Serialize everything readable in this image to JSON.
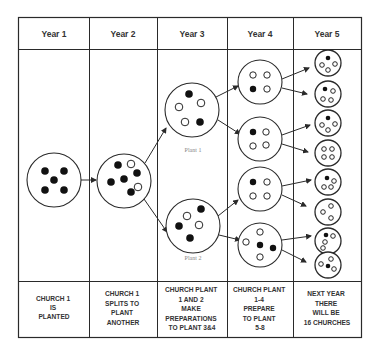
{
  "colors": {
    "line": "#2a2a2a",
    "text": "#333333",
    "label_grey": "#888888",
    "background": "#ffffff"
  },
  "columns": [
    {
      "header": "Year 1",
      "footer": [
        "CHURCH 1",
        "IS",
        "PLANTED"
      ]
    },
    {
      "header": "Year 2",
      "footer": [
        "CHURCH 1",
        "SPLITS TO",
        "PLANT",
        "ANOTHER"
      ]
    },
    {
      "header": "Year 3",
      "footer": [
        "CHURCH PLANT",
        "1 AND 2",
        "MAKE",
        "PREPARATIONS",
        "TO PLANT 3&4"
      ]
    },
    {
      "header": "Year 4",
      "footer": [
        "CHURCH PLANT",
        "1-4",
        "PREPARE",
        "TO PLANT",
        "5-8"
      ]
    },
    {
      "header": "Year 5",
      "footer": [
        "NEXT YEAR",
        "THERE",
        "WILL BE",
        "16 CHURCHES"
      ]
    }
  ],
  "plant_labels": {
    "plant1": "Plant 1",
    "plant2": "Plant 2"
  },
  "churches": {
    "year1": [
      {
        "cx": 54,
        "cy": 180,
        "r": 27,
        "dots": [
          [
            -9,
            -9,
            "f"
          ],
          [
            10,
            -9,
            "f"
          ],
          [
            0,
            0,
            "f"
          ],
          [
            -9,
            10,
            "f"
          ],
          [
            10,
            10,
            "f"
          ]
        ]
      }
    ],
    "year2": [
      {
        "cx": 124,
        "cy": 181,
        "r": 27,
        "dots": [
          [
            -6,
            -16,
            "f"
          ],
          [
            7,
            -17,
            "o"
          ],
          [
            13,
            -8,
            "f"
          ],
          [
            -13,
            1,
            "f"
          ],
          [
            0,
            -2,
            "f"
          ],
          [
            14,
            6,
            "o"
          ],
          [
            7,
            11,
            "f"
          ]
        ]
      }
    ],
    "year3": [
      {
        "cx": 192,
        "cy": 110,
        "r": 27,
        "dots": [
          [
            -3,
            -16,
            "f"
          ],
          [
            -13,
            -3,
            "o"
          ],
          [
            9,
            -7,
            "o"
          ],
          [
            -7,
            12,
            "o"
          ],
          [
            8,
            12,
            "f"
          ]
        ]
      },
      {
        "cx": 193,
        "cy": 226,
        "r": 27,
        "dots": [
          [
            8,
            -17,
            "f"
          ],
          [
            -6,
            -10,
            "o"
          ],
          [
            -14,
            0,
            "f"
          ],
          [
            6,
            -1,
            "o"
          ],
          [
            -3,
            12,
            "f"
          ]
        ]
      }
    ],
    "year4": [
      {
        "cx": 260,
        "cy": 82,
        "r": 22,
        "dots": [
          [
            -7,
            -7,
            "o"
          ],
          [
            7,
            -7,
            "o"
          ],
          [
            -7,
            7,
            "f"
          ],
          [
            7,
            7,
            "o"
          ]
        ]
      },
      {
        "cx": 260,
        "cy": 139,
        "r": 22,
        "dots": [
          [
            -7,
            -7,
            "f"
          ],
          [
            6,
            -7,
            "o"
          ],
          [
            -7,
            7,
            "o"
          ],
          [
            6,
            6,
            "o"
          ]
        ]
      },
      {
        "cx": 260,
        "cy": 189,
        "r": 22,
        "dots": [
          [
            -7,
            -7,
            "f"
          ],
          [
            7,
            -7,
            "o"
          ],
          [
            -7,
            7,
            "o"
          ],
          [
            7,
            7,
            "o"
          ]
        ]
      },
      {
        "cx": 260,
        "cy": 245,
        "r": 22,
        "dots": [
          [
            0,
            -13,
            "o"
          ],
          [
            -14,
            -3,
            "o"
          ],
          [
            0,
            0,
            "f"
          ],
          [
            13,
            3,
            "f"
          ],
          [
            0,
            12,
            "o"
          ]
        ]
      }
    ],
    "year5": [
      {
        "cx": 328,
        "cy": 63,
        "r": 13,
        "dots": [
          [
            0,
            -5,
            "f"
          ],
          [
            -6,
            2,
            "o"
          ],
          [
            7,
            1,
            "o"
          ],
          [
            0,
            7,
            "o"
          ]
        ]
      },
      {
        "cx": 328,
        "cy": 94,
        "r": 13,
        "dots": [
          [
            -3,
            -5,
            "f"
          ],
          [
            5,
            -3,
            "o"
          ],
          [
            -5,
            5,
            "o"
          ],
          [
            3,
            6,
            "o"
          ]
        ]
      },
      {
        "cx": 328,
        "cy": 123,
        "r": 13,
        "dots": [
          [
            0,
            -5,
            "f"
          ],
          [
            -6,
            2,
            "o"
          ],
          [
            7,
            1,
            "o"
          ],
          [
            0,
            7,
            "o"
          ]
        ]
      },
      {
        "cx": 328,
        "cy": 153,
        "r": 13,
        "dots": [
          [
            -4,
            -4,
            "o"
          ],
          [
            4,
            -4,
            "o"
          ],
          [
            -4,
            4,
            "o"
          ],
          [
            4,
            4,
            "o"
          ]
        ]
      },
      {
        "cx": 328,
        "cy": 182,
        "r": 13,
        "dots": [
          [
            -1,
            -4,
            "f"
          ],
          [
            6,
            -1,
            "o"
          ],
          [
            -4,
            5,
            "o"
          ],
          [
            3,
            5,
            "o"
          ]
        ]
      },
      {
        "cx": 328,
        "cy": 212,
        "r": 13,
        "dots": [
          [
            3,
            -6,
            "o"
          ],
          [
            -5,
            0,
            "o"
          ],
          [
            3,
            6,
            "o"
          ]
        ]
      },
      {
        "cx": 328,
        "cy": 241,
        "r": 13,
        "dots": [
          [
            -2,
            -6,
            "f"
          ],
          [
            5,
            -5,
            "o"
          ],
          [
            -3,
            1,
            "o"
          ],
          [
            -5,
            7,
            "o"
          ]
        ]
      },
      {
        "cx": 328,
        "cy": 265,
        "r": 13,
        "dots": [
          [
            3,
            -6,
            "o"
          ],
          [
            -7,
            -1,
            "o"
          ],
          [
            0,
            1,
            "f"
          ],
          [
            6,
            4,
            "o"
          ]
        ]
      }
    ]
  },
  "arrows": [
    [
      81,
      180,
      96,
      180
    ],
    [
      145,
      163,
      166,
      128
    ],
    [
      144,
      199,
      167,
      232
    ],
    [
      216,
      97,
      238,
      86
    ],
    [
      218,
      120,
      240,
      134
    ],
    [
      218,
      216,
      238,
      200
    ],
    [
      219,
      235,
      240,
      240
    ],
    [
      282,
      79,
      309,
      68
    ],
    [
      282,
      88,
      307,
      94
    ],
    [
      282,
      135,
      310,
      125
    ],
    [
      282,
      144,
      308,
      152
    ],
    [
      282,
      186,
      311,
      180
    ],
    [
      282,
      195,
      306,
      206
    ],
    [
      282,
      240,
      311,
      236
    ],
    [
      282,
      250,
      306,
      262
    ]
  ]
}
